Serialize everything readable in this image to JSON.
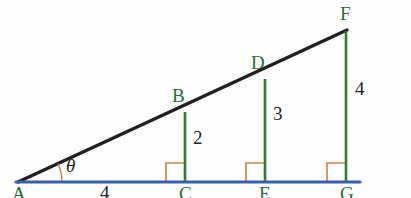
{
  "figure": {
    "colors": {
      "baseline": "#3a5fa8",
      "hypotenuse": "#231f1f",
      "vertical": "#2e7d32",
      "right_angle": "#d2854a",
      "arc": "#d2854a",
      "vertex_label": "#2e6b3a",
      "measure_label": "#262626",
      "background": "#fdfdfd"
    },
    "vertices": {
      "A": "A",
      "B": "B",
      "C": "C",
      "D": "D",
      "E": "E",
      "F": "F",
      "G": "G"
    },
    "measures": {
      "base_AC": "4",
      "height_BC": "2",
      "height_DE": "3",
      "height_FG": "4",
      "angle": "θ"
    },
    "geometry": {
      "A": [
        18,
        182
      ],
      "C": [
        185,
        182
      ],
      "E": [
        265,
        182
      ],
      "G": [
        346,
        182
      ],
      "B": [
        185,
        113
      ],
      "D": [
        265,
        80
      ],
      "F": [
        346,
        31
      ],
      "baseline_end": [
        360,
        182
      ],
      "right_angle_size": 19,
      "arc_radius": 44
    }
  }
}
